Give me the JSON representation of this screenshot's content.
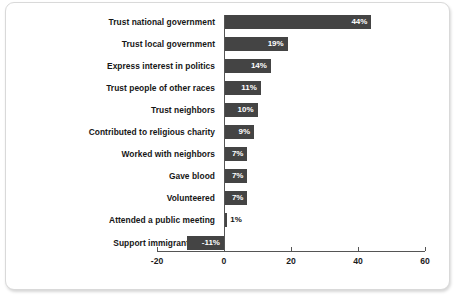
{
  "chart_data": {
    "type": "bar",
    "orientation": "horizontal",
    "title": "",
    "subtitle": "",
    "xlabel": "",
    "ylabel": "",
    "xlim": [
      -20,
      60
    ],
    "xticks": [
      -20,
      0,
      20,
      40,
      60
    ],
    "xtick_labels": [
      "-20",
      "0",
      "20",
      "40",
      "60"
    ],
    "grid": false,
    "legend": false,
    "value_suffix": "%",
    "bar_color": "#444444",
    "inside_label_color": "#ffffff",
    "outside_label_color": "#111111",
    "categories": [
      "Trust national government",
      "Trust local government",
      "Express interest in politics",
      "Trust people of other races",
      "Trust neighbors",
      "Contributed to religious charity",
      "Worked with neighbors",
      "Gave blood",
      "Volunteered",
      "Attended a public meeting",
      "Support immigrant rights"
    ],
    "values": [
      44,
      19,
      14,
      11,
      10,
      9,
      7,
      7,
      7,
      1,
      -11
    ],
    "data_labels": [
      "44%",
      "19%",
      "14%",
      "11%",
      "10%",
      "9%",
      "7%",
      "7%",
      "7%",
      "1%",
      "-11%"
    ]
  }
}
